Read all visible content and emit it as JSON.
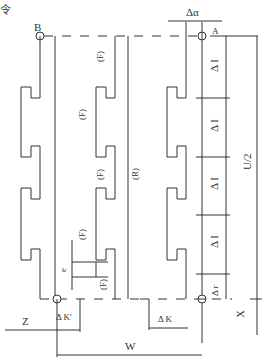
{
  "diagram": {
    "corner_glyph": "令",
    "points": {
      "start_left": "B",
      "start_right": "A"
    },
    "labels": {
      "delta_alpha": "Δα",
      "delta_i": "Δ I",
      "delta_r": "Δ r",
      "delta_k": "Δ K",
      "delta_k_prime": "Δ K'",
      "u_half": "U/2",
      "z": "Z",
      "x": "X",
      "w": "W",
      "e": "e",
      "feed": "(F)",
      "rapid": "(R)"
    },
    "delta_i_count": 4
  }
}
